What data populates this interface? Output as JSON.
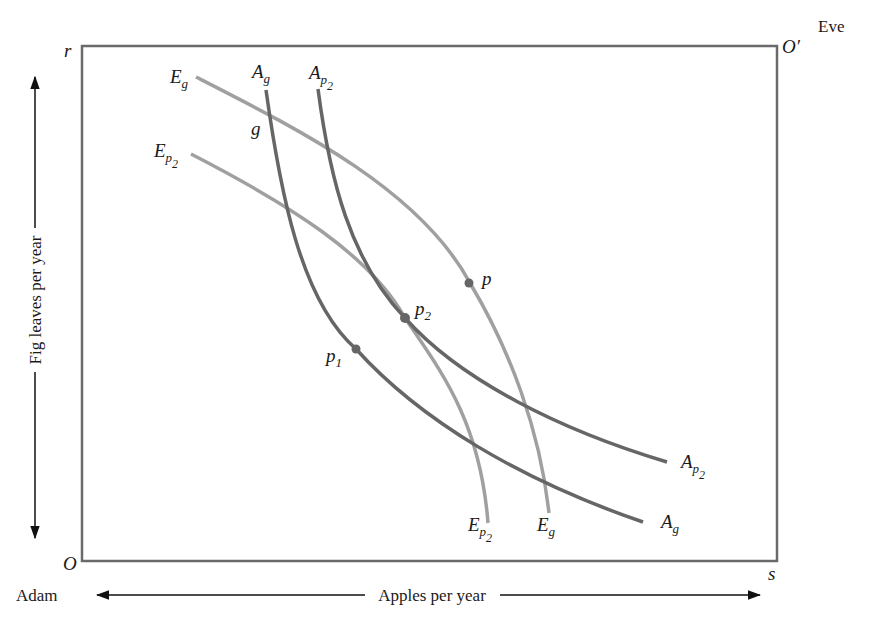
{
  "figure": {
    "owner_bottom_left": "Adam",
    "owner_top_right": "Eve",
    "corner_bottom_left": "O",
    "corner_top_left": "r",
    "corner_top_right": "O′",
    "corner_bottom_right": "s",
    "x_axis_label": "Apples per year",
    "y_axis_label": "Fig leaves per year"
  },
  "curves": {
    "Eg": {
      "base": "E",
      "sub": "g",
      "subsub": "",
      "color": "#a0a0a0"
    },
    "Ep2": {
      "base": "E",
      "sub": "p",
      "subsub": "2",
      "color": "#a0a0a0"
    },
    "Ag": {
      "base": "A",
      "sub": "g",
      "subsub": "",
      "color": "#666666"
    },
    "Ap2": {
      "base": "A",
      "sub": "p",
      "subsub": "2",
      "color": "#666666"
    }
  },
  "points": {
    "g": {
      "label": "g"
    },
    "p": {
      "label": "p"
    },
    "p1": {
      "base": "p",
      "sub": "1"
    },
    "p2": {
      "base": "p",
      "sub": "2"
    }
  },
  "colors": {
    "box": "#6a6a6a",
    "eve_curves": "#a0a0a0",
    "adam_curves": "#666666",
    "points": "#666666",
    "text": "#1a1a1a"
  }
}
